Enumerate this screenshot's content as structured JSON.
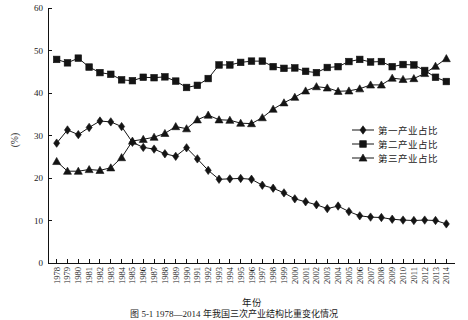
{
  "chart_data": {
    "type": "line",
    "title": "",
    "xlabel": "年份",
    "ylabel": "(%)",
    "ylim": [
      0,
      60
    ],
    "yticks": [
      0,
      10,
      20,
      30,
      40,
      50,
      60
    ],
    "grid": false,
    "legend_position": "right-middle",
    "categories": [
      "1978",
      "1979",
      "1980",
      "1981",
      "1982",
      "1983",
      "1984",
      "1985",
      "1986",
      "1987",
      "1988",
      "1989",
      "1990",
      "1991",
      "1992",
      "1993",
      "1994",
      "1995",
      "1996",
      "1997",
      "1998",
      "1999",
      "2000",
      "2001",
      "2002",
      "2003",
      "2004",
      "2005",
      "2006",
      "2007",
      "2008",
      "2009",
      "2010",
      "2011",
      "2012",
      "2013",
      "2014"
    ],
    "series": [
      {
        "name": "第一产业占比",
        "marker": "diamond",
        "values": [
          28.2,
          31.3,
          30.2,
          31.9,
          33.4,
          33.2,
          32.1,
          28.4,
          27.2,
          26.8,
          25.7,
          25.1,
          27.1,
          24.5,
          21.8,
          19.7,
          19.8,
          19.9,
          19.7,
          18.3,
          17.6,
          16.5,
          15.1,
          14.4,
          13.7,
          12.8,
          13.4,
          12.1,
          11.1,
          10.8,
          10.7,
          10.3,
          10.1,
          10.0,
          10.1,
          10.0,
          9.2
        ]
      },
      {
        "name": "第二产业占比",
        "marker": "square",
        "values": [
          47.9,
          47.1,
          48.2,
          46.1,
          44.8,
          44.4,
          43.1,
          42.9,
          43.7,
          43.6,
          43.8,
          42.8,
          41.3,
          41.8,
          43.4,
          46.6,
          46.6,
          47.2,
          47.5,
          47.5,
          46.2,
          45.8,
          45.9,
          45.1,
          44.8,
          46.0,
          46.2,
          47.4,
          47.9,
          47.3,
          47.4,
          46.2,
          46.7,
          46.6,
          45.3,
          43.7,
          42.7
        ]
      },
      {
        "name": "第三产业占比",
        "marker": "triangle",
        "values": [
          23.9,
          21.6,
          21.6,
          22.0,
          21.8,
          22.4,
          24.8,
          28.7,
          29.1,
          29.6,
          30.5,
          32.1,
          31.6,
          33.7,
          34.8,
          33.7,
          33.6,
          32.9,
          32.8,
          34.2,
          36.2,
          37.7,
          39.0,
          40.5,
          41.5,
          41.2,
          40.4,
          40.5,
          41.0,
          41.9,
          41.9,
          43.5,
          43.2,
          43.4,
          44.6,
          46.3,
          48.1
        ]
      }
    ]
  },
  "legend": {
    "items": [
      {
        "label": "第一产业占比",
        "marker": "diamond"
      },
      {
        "label": "第二产业占比",
        "marker": "square"
      },
      {
        "label": "第三产业占比",
        "marker": "triangle"
      }
    ]
  },
  "axes": {
    "y_axis_label": "(%)",
    "x_axis_label": "年份"
  },
  "caption": "图 5-1  1978—2014 年我国三次产业结构比重变化情况"
}
